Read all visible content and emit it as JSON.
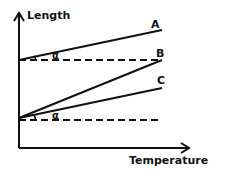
{
  "diagram": {
    "type": "length-vs-temperature thermal expansion graph",
    "axes": {
      "y_label": "Length",
      "x_label": "Temperature"
    },
    "lines": [
      {
        "label": "A",
        "style": "solid",
        "from": [
          19,
          60
        ],
        "to": [
          162,
          30
        ]
      },
      {
        "label": "B",
        "style": "solid",
        "from": [
          19,
          118
        ],
        "to": [
          162,
          60
        ]
      },
      {
        "label": "C",
        "style": "solid",
        "from": [
          19,
          118
        ],
        "to": [
          162,
          88
        ]
      }
    ],
    "reference_lines": [
      {
        "style": "dashed",
        "y": 60
      },
      {
        "style": "dashed",
        "y": 120
      }
    ],
    "angles": [
      {
        "label": "α",
        "between": "A and upper dashed line"
      },
      {
        "label": "α",
        "between": "C and lower dashed line"
      }
    ],
    "colors": {
      "ink": "#111111",
      "background": "#ffffff"
    }
  }
}
